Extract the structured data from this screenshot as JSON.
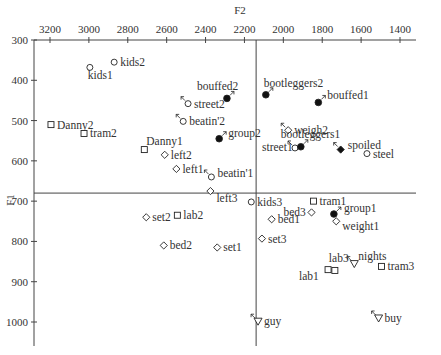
{
  "chart_data": {
    "type": "scatter",
    "title": "",
    "xlabel": "F2",
    "ylabel": "F1",
    "xlim": [
      3200,
      1300
    ],
    "ylim": [
      300,
      1060
    ],
    "x_reversed": true,
    "y_reversed": true,
    "x_axis_position": "top",
    "x_ticks": [
      3200,
      3000,
      2800,
      2600,
      2400,
      2200,
      2000,
      1800,
      1600,
      1400
    ],
    "y_ticks": [
      300,
      400,
      500,
      600,
      700,
      800,
      900,
      1000
    ],
    "reference_lines": {
      "F2": 2140,
      "F1": 680
    },
    "grid": false,
    "legend": "none",
    "points": [
      {
        "label": "kids2",
        "F2": 2870,
        "F1": 355,
        "marker": "circle-open",
        "arrow": ""
      },
      {
        "label": "kids1",
        "F2": 2995,
        "F1": 368,
        "marker": "circle-open",
        "arrow": ""
      },
      {
        "label": "Danny2",
        "F2": 3195,
        "F1": 510,
        "marker": "square-open",
        "arrow": ""
      },
      {
        "label": "tram2",
        "F2": 3025,
        "F1": 532,
        "marker": "square-open",
        "arrow": ""
      },
      {
        "label": "Danny1",
        "F2": 2715,
        "F1": 572,
        "marker": "square-open",
        "arrow": ""
      },
      {
        "label": "left2",
        "F2": 2610,
        "F1": 585,
        "marker": "diamond-open",
        "arrow": ""
      },
      {
        "label": "left1",
        "F2": 2550,
        "F1": 620,
        "marker": "diamond-open",
        "arrow": ""
      },
      {
        "label": "beatin'1",
        "F2": 2370,
        "F1": 640,
        "marker": "circle-open",
        "arrow": "up-left"
      },
      {
        "label": "left3",
        "F2": 2375,
        "F1": 675,
        "marker": "diamond-open",
        "arrow": ""
      },
      {
        "label": "street2",
        "F2": 2490,
        "F1": 458,
        "marker": "circle-open",
        "arrow": "up-left"
      },
      {
        "label": "beatin'2",
        "F2": 2515,
        "F1": 502,
        "marker": "circle-open",
        "arrow": "up-left"
      },
      {
        "label": "bouffed2",
        "F2": 2290,
        "F1": 445,
        "marker": "circle-filled",
        "arrow": "up-right"
      },
      {
        "label": "group2",
        "F2": 2330,
        "F1": 545,
        "marker": "circle-filled",
        "arrow": "up-right"
      },
      {
        "label": "bootleggers2",
        "F2": 2090,
        "F1": 436,
        "marker": "circle-filled",
        "arrow": "up-right"
      },
      {
        "label": "bouffed1",
        "F2": 1820,
        "F1": 455,
        "marker": "circle-filled",
        "arrow": "up-right"
      },
      {
        "label": "weigh2",
        "F2": 1975,
        "F1": 524,
        "marker": "diamond-open",
        "arrow": "up-left"
      },
      {
        "label": "street1",
        "F2": 1940,
        "F1": 568,
        "marker": "circle-open",
        "arrow": "up-left"
      },
      {
        "label": "bootleggers1",
        "F2": 1910,
        "F1": 565,
        "marker": "circle-filled",
        "arrow": "up-right"
      },
      {
        "label": "spoiled",
        "F2": 1705,
        "F1": 572,
        "marker": "diamond-filled",
        "arrow": "up-left"
      },
      {
        "label": "steel",
        "F2": 1570,
        "F1": 582,
        "marker": "circle-open",
        "arrow": ""
      },
      {
        "label": "kids3",
        "F2": 2165,
        "F1": 702,
        "marker": "circle-open",
        "arrow": ""
      },
      {
        "label": "tram1",
        "F2": 1845,
        "F1": 700,
        "marker": "square-open",
        "arrow": ""
      },
      {
        "label": "bed3",
        "F2": 1855,
        "F1": 728,
        "marker": "diamond-open",
        "arrow": ""
      },
      {
        "label": "group1",
        "F2": 1740,
        "F1": 732,
        "marker": "circle-filled",
        "arrow": "up-right"
      },
      {
        "label": "weight1",
        "F2": 1728,
        "F1": 750,
        "marker": "diamond-open",
        "arrow": ""
      },
      {
        "label": "set2",
        "F2": 2705,
        "F1": 740,
        "marker": "diamond-open",
        "arrow": ""
      },
      {
        "label": "lab2",
        "F2": 2545,
        "F1": 735,
        "marker": "square-open",
        "arrow": ""
      },
      {
        "label": "bed1",
        "F2": 2060,
        "F1": 745,
        "marker": "diamond-open",
        "arrow": ""
      },
      {
        "label": "set3",
        "F2": 2110,
        "F1": 793,
        "marker": "diamond-open",
        "arrow": ""
      },
      {
        "label": "bed2",
        "F2": 2615,
        "F1": 810,
        "marker": "diamond-open",
        "arrow": ""
      },
      {
        "label": "set1",
        "F2": 2340,
        "F1": 815,
        "marker": "diamond-open",
        "arrow": ""
      },
      {
        "label": "lab3",
        "F2": 1735,
        "F1": 872,
        "marker": "square-open",
        "arrow": ""
      },
      {
        "label": "lab1",
        "F2": 1770,
        "F1": 870,
        "marker": "square-open",
        "arrow": ""
      },
      {
        "label": "nights",
        "F2": 1635,
        "F1": 855,
        "marker": "triangle-open",
        "arrow": "up-left"
      },
      {
        "label": "tram3",
        "F2": 1495,
        "F1": 862,
        "marker": "square-open",
        "arrow": ""
      },
      {
        "label": "guy",
        "F2": 2130,
        "F1": 998,
        "marker": "triangle-open",
        "arrow": "up-left"
      },
      {
        "label": "buy",
        "F2": 1510,
        "F1": 990,
        "marker": "triangle-open",
        "arrow": "up-left"
      }
    ]
  }
}
